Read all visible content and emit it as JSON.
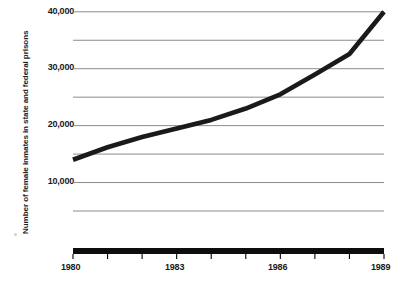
{
  "chart_data": {
    "type": "line",
    "title": "",
    "xlabel": "",
    "ylabel": "Number of female inmates in state and federal prisons",
    "x": [
      1980,
      1981,
      1982,
      1983,
      1984,
      1985,
      1986,
      1987,
      1988,
      1989
    ],
    "values": [
      14000,
      16200,
      18000,
      19500,
      21000,
      23000,
      25500,
      29000,
      32600,
      40000
    ],
    "series": [
      {
        "name": "Number of female inmates in state and federal prisons",
        "values": [
          14000,
          16200,
          18000,
          19500,
          21000,
          23000,
          25500,
          29000,
          32600,
          40000
        ]
      }
    ],
    "xlim": [
      1980,
      1989
    ],
    "ylim": [
      0,
      40000
    ],
    "grid": true,
    "legend": false,
    "legend_position": "none",
    "x_tick_labels": [
      "1980",
      "1983",
      "1986",
      "1989"
    ],
    "x_tick_values": [
      1980,
      1983,
      1986,
      1989
    ],
    "x_minor_ticks": [
      1980,
      1981,
      1982,
      1983,
      1984,
      1985,
      1986,
      1987,
      1988,
      1989
    ],
    "y_tick_labels": [
      "40,000",
      "30,000",
      "20,000",
      "10,000"
    ],
    "y_tick_values": [
      40000,
      30000,
      20000,
      10000
    ],
    "y_gridline_values": [
      40000,
      35000,
      30000,
      25000,
      20000,
      15000,
      10000,
      5000
    ],
    "line_color": "#1a1a1a",
    "gridline_color": "#8c8c8c",
    "axis_color": "#000000",
    "background_color": "#ffffff"
  }
}
